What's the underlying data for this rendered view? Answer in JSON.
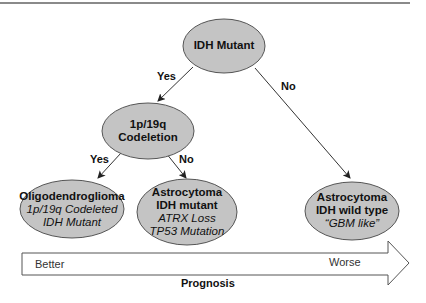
{
  "diagram": {
    "colors": {
      "node_fill": "#c4c4c4",
      "node_stroke": "#555555",
      "edge": "#333333",
      "top_rule": "#8a8a8a"
    },
    "nodes": {
      "root": {
        "title": "IDH Mutant"
      },
      "codeletion": {
        "line1": "1p/19q",
        "line2": "Codeletion"
      },
      "oligo": {
        "title": "Oligodendroglioma",
        "sub1": "1p/19q Codeleted",
        "sub2": "IDH Mutant"
      },
      "astro_mut": {
        "title1": "Astrocytoma",
        "title2": "IDH mutant",
        "sub1": "ATRX Loss",
        "sub2": "TP53 Mutation"
      },
      "astro_wt": {
        "title1": "Astrocytoma",
        "title2": "IDH wild type",
        "sub1": "“GBM like”"
      }
    },
    "edges": {
      "root_yes": "Yes",
      "root_no": "No",
      "codel_yes": "Yes",
      "codel_no": "No"
    },
    "prognosis_arrow": {
      "left_label": "Better",
      "right_label": "Worse",
      "title": "Prognosis"
    }
  }
}
